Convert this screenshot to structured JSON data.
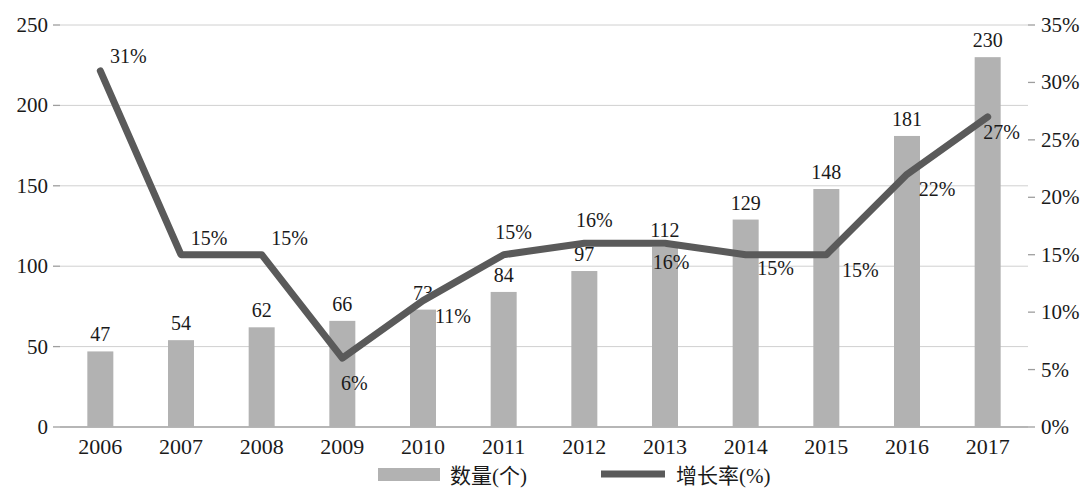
{
  "chart_data": {
    "type": "bar",
    "title": "",
    "subtitle": "",
    "xlabel": "",
    "ylabel": "",
    "categories": [
      "2006",
      "2007",
      "2008",
      "2009",
      "2010",
      "2011",
      "2012",
      "2013",
      "2014",
      "2015",
      "2016",
      "2017"
    ],
    "series": [
      {
        "name": "数量(个)",
        "type": "bar",
        "axis": "left",
        "values": [
          47,
          54,
          62,
          66,
          73,
          84,
          97,
          112,
          129,
          148,
          181,
          230
        ],
        "labels": [
          "47",
          "54",
          "62",
          "66",
          "73",
          "84",
          "97",
          "112",
          "129",
          "148",
          "181",
          "230"
        ],
        "color": "#b2b2b2"
      },
      {
        "name": "增长率(%)",
        "type": "line",
        "axis": "right",
        "values": [
          31,
          15,
          15,
          6,
          11,
          15,
          16,
          16,
          15,
          15,
          22,
          27
        ],
        "labels": [
          "31%",
          "15%",
          "15%",
          "6%",
          "11%",
          "15%",
          "16%",
          "16%",
          "15%",
          "15%",
          "22%",
          "27%"
        ],
        "color": "#5a5a5a"
      }
    ],
    "left_axis": {
      "ticks": [
        "0",
        "50",
        "100",
        "150",
        "200",
        "250"
      ],
      "tick_values": [
        0,
        50,
        100,
        150,
        200,
        250
      ],
      "min": 0,
      "max": 250
    },
    "right_axis": {
      "ticks": [
        "0%",
        "5%",
        "10%",
        "15%",
        "20%",
        "25%",
        "30%",
        "35%"
      ],
      "tick_values": [
        0,
        5,
        10,
        15,
        20,
        25,
        30,
        35
      ],
      "min": 0,
      "max": 35
    },
    "legend": {
      "position": "bottom",
      "entries": [
        {
          "label": "数量(个)",
          "marker": "bar-swatch"
        },
        {
          "label": "增长率(%)",
          "marker": "line-swatch"
        }
      ]
    },
    "grid": {
      "horizontal": true,
      "vertical": false
    }
  }
}
